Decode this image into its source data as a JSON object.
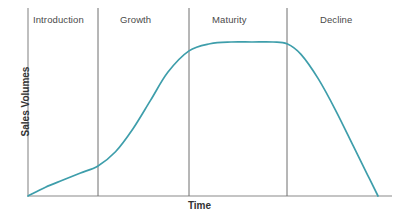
{
  "chart_data": {
    "type": "line",
    "title": "",
    "xlabel": "Time",
    "ylabel": "Sales Volumes",
    "grid": false,
    "legend": "none",
    "axis_ticks": "none",
    "xlim": [
      0,
      100
    ],
    "ylim": [
      0,
      100
    ],
    "line_color": "#3e9eab",
    "axis_color": "#8a8a8a",
    "divider_color": "#6e6e6e",
    "label_color": "#4a4a4a",
    "title_color": "#333333",
    "stages": [
      {
        "label": "Introduction",
        "x_start": 0,
        "x_end": 20
      },
      {
        "label": "Growth",
        "x_start": 20,
        "x_end": 46
      },
      {
        "label": "Maturity",
        "x_start": 46,
        "x_end": 74
      },
      {
        "label": "Decline",
        "x_start": 74,
        "x_end": 100
      }
    ],
    "dividers_x": [
      20,
      46,
      74
    ],
    "series": [
      {
        "name": "Sales Volumes",
        "x": [
          0,
          5,
          10,
          15,
          20,
          25,
          30,
          35,
          40,
          46,
          52,
          58,
          64,
          70,
          74,
          78,
          83,
          88,
          93,
          97,
          100
        ],
        "y": [
          0,
          5,
          9,
          13,
          17,
          25,
          38,
          54,
          70,
          82,
          86,
          87,
          87,
          87,
          86,
          80,
          66,
          48,
          28,
          12,
          0
        ]
      }
    ],
    "annotations": []
  },
  "stage_label_positions": [
    {
      "left_px": 33,
      "top_px": 14
    },
    {
      "left_px": 120,
      "top_px": 14
    },
    {
      "left_px": 212,
      "top_px": 14
    },
    {
      "left_px": 320,
      "top_px": 14
    }
  ]
}
